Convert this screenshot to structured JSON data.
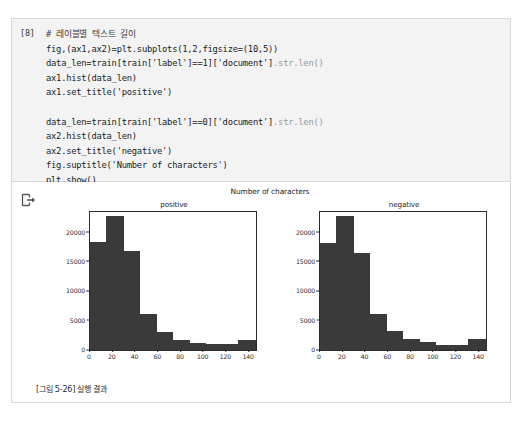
{
  "notebook": {
    "cell": {
      "prompt_label": "[8]",
      "code_lines": [
        {
          "text": "# 레이블별 텍스트 길이",
          "style": "comment"
        },
        {
          "text": "fig,(ax1,ax2)=plt.subplots(1,2,figsize=(10,5))",
          "style": "code"
        },
        {
          "text": "data_len=train[train['label']==1]['document']",
          "trail": ".str.len()",
          "style": "code"
        },
        {
          "text": "ax1.hist(data_len)",
          "style": "code"
        },
        {
          "text": "ax1.set_title('positive')",
          "style": "code"
        },
        {
          "text": "",
          "style": "blank"
        },
        {
          "text": "data_len=train[train['label']==0]['document']",
          "trail": ".str.len()",
          "style": "code"
        },
        {
          "text": "ax2.hist(data_len)",
          "style": "code"
        },
        {
          "text": "ax2.set_title('negative')",
          "style": "code"
        },
        {
          "text": "fig.suptitle('Number of characters')",
          "style": "code"
        },
        {
          "text": "plt.show()",
          "style": "code"
        }
      ]
    },
    "output": {
      "marker_icon": "output-arrow-icon",
      "caption": "[그림 5-26] 실행 결과"
    }
  },
  "colors": {
    "bar_fill": "#3a3a3a",
    "axis": "#2b2b2b",
    "cell_background": "#f3f3f3",
    "frame_border": "#d8d8d8"
  },
  "chart_data": [
    {
      "type": "bar",
      "title": "positive",
      "suptitle": "Number of characters",
      "xlabel": "",
      "ylabel": "",
      "xlim": [
        0,
        146
      ],
      "ylim": [
        0,
        23500
      ],
      "xticks": [
        0,
        20,
        40,
        60,
        80,
        100,
        120,
        140
      ],
      "yticks": [
        0,
        5000,
        10000,
        15000,
        20000
      ],
      "grid": false,
      "legend": "none",
      "bin_edges": [
        0,
        14.5,
        29,
        43.5,
        58,
        72.5,
        87,
        101.5,
        116,
        130.5,
        145
      ],
      "categories": [
        "0-14",
        "15-29",
        "30-43",
        "44-58",
        "59-72",
        "73-87",
        "88-101",
        "102-116",
        "117-130",
        "131-145"
      ],
      "values": [
        18400,
        22800,
        16900,
        6100,
        3100,
        1700,
        1200,
        1050,
        1000,
        1700
      ]
    },
    {
      "type": "bar",
      "title": "negative",
      "suptitle": "Number of characters",
      "xlabel": "",
      "ylabel": "",
      "xlim": [
        0,
        146
      ],
      "ylim": [
        0,
        23500
      ],
      "xticks": [
        0,
        20,
        40,
        60,
        80,
        100,
        120,
        140
      ],
      "yticks": [
        0,
        5000,
        10000,
        15000,
        20000
      ],
      "grid": false,
      "legend": "none",
      "bin_edges": [
        0,
        14.5,
        29,
        43.5,
        58,
        72.5,
        87,
        101.5,
        116,
        130.5,
        145
      ],
      "categories": [
        "0-14",
        "15-29",
        "30-43",
        "44-58",
        "59-72",
        "73-87",
        "88-101",
        "102-116",
        "117-130",
        "131-145"
      ],
      "values": [
        18200,
        22900,
        16600,
        6200,
        3200,
        1800,
        1300,
        900,
        900,
        1800
      ]
    }
  ]
}
